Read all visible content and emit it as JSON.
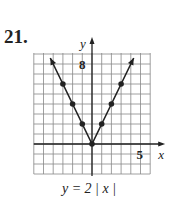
{
  "problem_number": "21.",
  "equation": "y = 2 | x |",
  "chart_data": {
    "type": "line",
    "xlabel": "x",
    "ylabel": "y",
    "tick_labels": {
      "x": [
        "5"
      ],
      "y": [
        "8"
      ]
    },
    "xlim": [
      -6,
      6
    ],
    "ylim": [
      -3,
      9
    ],
    "grid": true,
    "series": [
      {
        "name": "y = 2|x|",
        "x": [
          -3,
          -2,
          -1,
          0,
          1,
          2,
          3
        ],
        "y": [
          6,
          4,
          2,
          0,
          2,
          4,
          6
        ]
      }
    ],
    "arrows": "both ends",
    "color": "#222222"
  }
}
